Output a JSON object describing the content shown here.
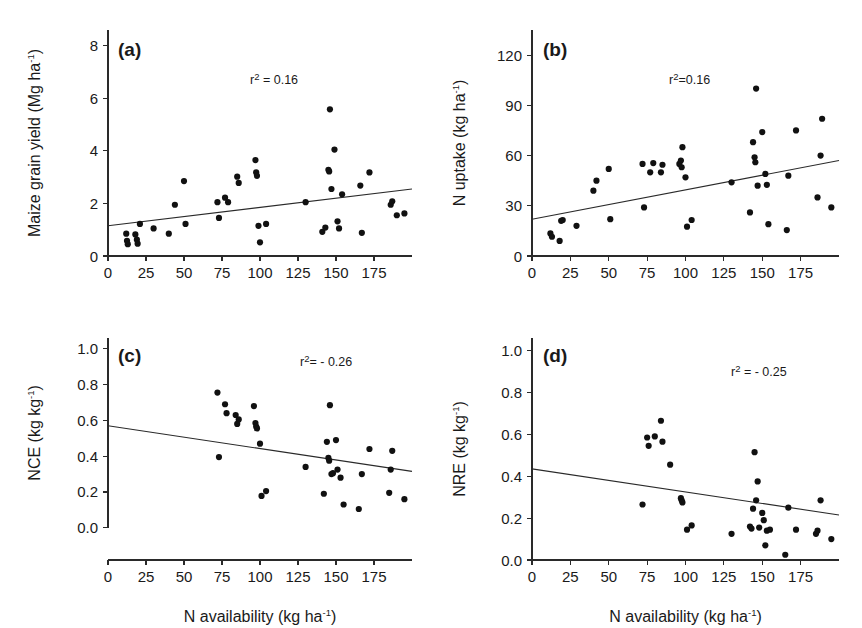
{
  "figure": {
    "xlabel": "N availability (kg ha",
    "xlabel_sup": "-1",
    "xlabel_close": ")",
    "xticks": [
      "0",
      "25",
      "50",
      "75",
      "100",
      "125",
      "150",
      "175"
    ],
    "xtick_values": [
      0,
      25,
      50,
      75,
      100,
      125,
      150,
      175
    ],
    "xlim": [
      0,
      200
    ],
    "point_color": "#111111",
    "axis_color": "#2a2a2a"
  },
  "chart_data": [
    {
      "type": "scatter",
      "panel": "a",
      "panel_label": "(a)",
      "title": "",
      "xlabel": "N availability (kg ha-1)",
      "ylabel": "Maize grain yield (Mg ha-1)",
      "ylabel_main": "Maize grain yield (Mg ha",
      "ylabel_sup": "-1",
      "ylabel_close": ")",
      "annotation": "r",
      "annotation_sup": "2",
      "annotation_rest": " = 0.16",
      "r_squared": 0.16,
      "xlim": [
        0,
        200
      ],
      "ylim": [
        0,
        8.6
      ],
      "yticks": [
        "0",
        "2",
        "4",
        "6",
        "8"
      ],
      "ytick_values": [
        0,
        2,
        4,
        6,
        8
      ],
      "grid": false,
      "legend": "none",
      "fit_line": {
        "x0": 0,
        "y0": 1.15,
        "x1": 200,
        "y1": 2.55
      },
      "points": [
        [
          12,
          0.85
        ],
        [
          12.5,
          0.58
        ],
        [
          13,
          0.45
        ],
        [
          18,
          0.82
        ],
        [
          19,
          0.62
        ],
        [
          19.5,
          0.47
        ],
        [
          21,
          1.22
        ],
        [
          30,
          1.05
        ],
        [
          40,
          0.85
        ],
        [
          44,
          1.95
        ],
        [
          50,
          2.85
        ],
        [
          51,
          1.22
        ],
        [
          72,
          2.05
        ],
        [
          73,
          1.45
        ],
        [
          77,
          2.22
        ],
        [
          79,
          2.05
        ],
        [
          85,
          3.02
        ],
        [
          86,
          2.78
        ],
        [
          97,
          3.65
        ],
        [
          97.5,
          3.18
        ],
        [
          98,
          3.05
        ],
        [
          99,
          1.15
        ],
        [
          100,
          0.52
        ],
        [
          104,
          1.22
        ],
        [
          130,
          2.05
        ],
        [
          141,
          0.92
        ],
        [
          143,
          1.08
        ],
        [
          145,
          3.28
        ],
        [
          145.5,
          3.22
        ],
        [
          146,
          5.58
        ],
        [
          147,
          2.55
        ],
        [
          149,
          4.05
        ],
        [
          151,
          1.32
        ],
        [
          152,
          1.05
        ],
        [
          154,
          2.35
        ],
        [
          166,
          2.68
        ],
        [
          167,
          0.88
        ],
        [
          172,
          3.18
        ],
        [
          186,
          1.95
        ],
        [
          187,
          2.08
        ],
        [
          190,
          1.55
        ],
        [
          195,
          1.62
        ]
      ]
    },
    {
      "type": "scatter",
      "panel": "b",
      "panel_label": "(b)",
      "title": "",
      "xlabel": "N availability (kg ha-1)",
      "ylabel": "N uptake (kg ha-1)",
      "ylabel_main": "N uptake (kg ha",
      "ylabel_sup": "-1",
      "ylabel_close": ")",
      "annotation": "r",
      "annotation_sup": "2",
      "annotation_rest": "=0.16",
      "r_squared": 0.16,
      "xlim": [
        0,
        200
      ],
      "ylim": [
        0,
        135
      ],
      "yticks": [
        "0",
        "30",
        "60",
        "90",
        "120"
      ],
      "ytick_values": [
        0,
        30,
        60,
        90,
        120
      ],
      "grid": false,
      "legend": "none",
      "fit_line": {
        "x0": 0,
        "y0": 22,
        "x1": 200,
        "y1": 57
      },
      "points": [
        [
          12,
          13.5
        ],
        [
          13,
          11.5
        ],
        [
          18,
          9
        ],
        [
          19,
          21
        ],
        [
          20,
          21.5
        ],
        [
          29,
          18
        ],
        [
          40,
          39
        ],
        [
          42,
          45
        ],
        [
          50,
          52
        ],
        [
          51,
          22
        ],
        [
          72,
          55
        ],
        [
          73,
          29
        ],
        [
          77,
          50
        ],
        [
          79,
          55.5
        ],
        [
          84,
          50
        ],
        [
          85,
          54.5
        ],
        [
          96,
          55
        ],
        [
          97,
          57
        ],
        [
          97.5,
          53
        ],
        [
          98,
          65
        ],
        [
          100,
          47
        ],
        [
          101,
          17.5
        ],
        [
          104,
          21.5
        ],
        [
          130,
          44
        ],
        [
          142,
          26
        ],
        [
          144,
          68
        ],
        [
          145,
          59
        ],
        [
          145.5,
          56
        ],
        [
          146,
          100
        ],
        [
          147,
          42
        ],
        [
          150,
          74
        ],
        [
          152,
          49
        ],
        [
          153,
          42.5
        ],
        [
          154,
          19
        ],
        [
          166,
          15.5
        ],
        [
          167,
          48
        ],
        [
          172,
          75
        ],
        [
          186,
          35
        ],
        [
          188,
          60
        ],
        [
          189,
          82
        ],
        [
          195,
          29
        ]
      ]
    },
    {
      "type": "scatter",
      "panel": "c",
      "panel_label": "(c)",
      "title": "",
      "xlabel": "N availability (kg ha-1)",
      "ylabel": "NCE (kg kg-1)",
      "ylabel_main": "NCE (kg kg",
      "ylabel_sup": "-1",
      "ylabel_close": ")",
      "annotation": "r",
      "annotation_sup": "2",
      "annotation_rest": "= - 0.26",
      "r_squared": -0.26,
      "xlim": [
        0,
        200
      ],
      "ylim": [
        -0.18,
        1.06
      ],
      "yticks": [
        "0.0",
        "0.2",
        "0.4",
        "0.6",
        "0.8",
        "1.0"
      ],
      "ytick_values": [
        0.0,
        0.2,
        0.4,
        0.6,
        0.8,
        1.0
      ],
      "grid": false,
      "legend": "none",
      "fit_line": {
        "x0": 0,
        "y0": 0.57,
        "x1": 200,
        "y1": 0.315
      },
      "points": [
        [
          72,
          0.755
        ],
        [
          73,
          0.395
        ],
        [
          77,
          0.69
        ],
        [
          78,
          0.64
        ],
        [
          84,
          0.63
        ],
        [
          85,
          0.58
        ],
        [
          86,
          0.605
        ],
        [
          96,
          0.68
        ],
        [
          97,
          0.585
        ],
        [
          97.5,
          0.565
        ],
        [
          98,
          0.555
        ],
        [
          100,
          0.47
        ],
        [
          101,
          0.178
        ],
        [
          104,
          0.205
        ],
        [
          130,
          0.34
        ],
        [
          142,
          0.19
        ],
        [
          144,
          0.48
        ],
        [
          145,
          0.39
        ],
        [
          145.5,
          0.375
        ],
        [
          146,
          0.685
        ],
        [
          147,
          0.3
        ],
        [
          148,
          0.305
        ],
        [
          150,
          0.49
        ],
        [
          151,
          0.325
        ],
        [
          153,
          0.28
        ],
        [
          155,
          0.13
        ],
        [
          165,
          0.105
        ],
        [
          167,
          0.3
        ],
        [
          172,
          0.44
        ],
        [
          185,
          0.195
        ],
        [
          186,
          0.325
        ],
        [
          187,
          0.43
        ],
        [
          195,
          0.16
        ]
      ]
    },
    {
      "type": "scatter",
      "panel": "d",
      "panel_label": "(d)",
      "title": "",
      "xlabel": "N availability (kg ha-1)",
      "ylabel": "NRE (kg kg-1)",
      "ylabel_main": "NRE (kg kg",
      "ylabel_sup": "-1",
      "ylabel_close": ")",
      "annotation": "r",
      "annotation_sup": "2",
      "annotation_rest": " = - 0.25",
      "r_squared": -0.25,
      "xlim": [
        0,
        200
      ],
      "ylim": [
        0,
        1.06
      ],
      "yticks": [
        "0.0",
        "0.2",
        "0.4",
        "0.6",
        "0.8",
        "1.0"
      ],
      "ytick_values": [
        0.0,
        0.2,
        0.4,
        0.6,
        0.8,
        1.0
      ],
      "grid": false,
      "legend": "none",
      "fit_line": {
        "x0": 0,
        "y0": 0.435,
        "x1": 200,
        "y1": 0.215
      },
      "points": [
        [
          72,
          0.265
        ],
        [
          75,
          0.585
        ],
        [
          76,
          0.545
        ],
        [
          80,
          0.59
        ],
        [
          84,
          0.665
        ],
        [
          85,
          0.565
        ],
        [
          90,
          0.455
        ],
        [
          97,
          0.295
        ],
        [
          97.5,
          0.285
        ],
        [
          98,
          0.275
        ],
        [
          101,
          0.145
        ],
        [
          104,
          0.165
        ],
        [
          130,
          0.125
        ],
        [
          142,
          0.16
        ],
        [
          143,
          0.15
        ],
        [
          144,
          0.245
        ],
        [
          145,
          0.515
        ],
        [
          146,
          0.285
        ],
        [
          147,
          0.375
        ],
        [
          148,
          0.155
        ],
        [
          150,
          0.225
        ],
        [
          151,
          0.19
        ],
        [
          152,
          0.07
        ],
        [
          153,
          0.14
        ],
        [
          155,
          0.145
        ],
        [
          165,
          0.025
        ],
        [
          167,
          0.25
        ],
        [
          172,
          0.145
        ],
        [
          185,
          0.125
        ],
        [
          186,
          0.14
        ],
        [
          188,
          0.285
        ],
        [
          195,
          0.1
        ]
      ]
    }
  ]
}
